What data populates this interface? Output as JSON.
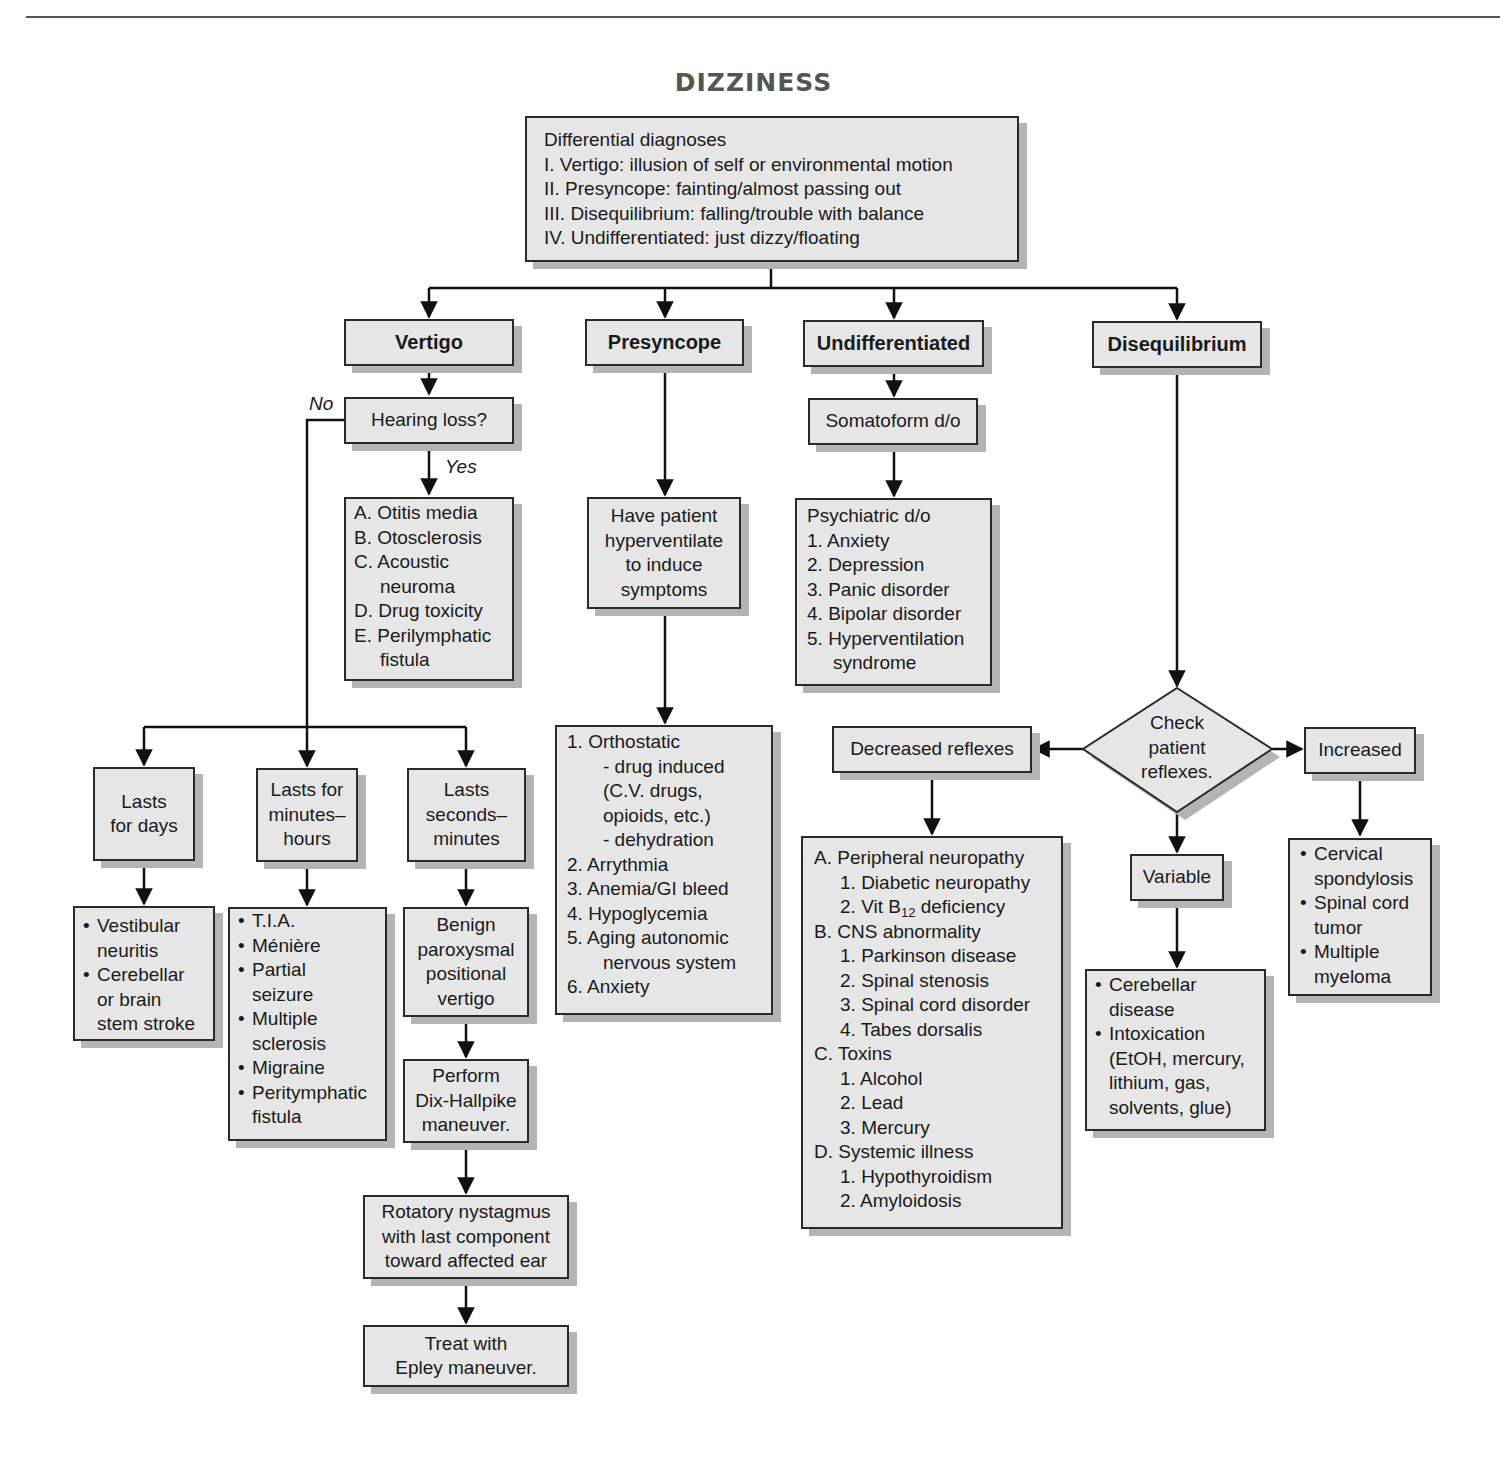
{
  "title": "DIZZINESS",
  "root": {
    "lines": [
      "Differential diagnoses",
      "I. Vertigo: illusion of self or environmental motion",
      "II. Presyncope: fainting/almost passing out",
      "III. Disequilibrium: falling/trouble with balance",
      "IV. Undifferentiated: just dizzy/floating"
    ]
  },
  "categories": {
    "vertigo": "Vertigo",
    "presyncope": "Presyncope",
    "undifferentiated": "Undifferentiated",
    "disequilibrium": "Disequilibrium"
  },
  "vertigo": {
    "question": "Hearing loss?",
    "no_label": "No",
    "yes_label": "Yes",
    "hearing_loss_causes": [
      {
        "marker": "A.",
        "text": "Otitis media"
      },
      {
        "marker": "B.",
        "text": "Otosclerosis"
      },
      {
        "marker": "C.",
        "text": "Acoustic",
        "cont": "neuroma"
      },
      {
        "marker": "D.",
        "text": "Drug toxicity"
      },
      {
        "marker": "E.",
        "text": "Perilymphatic",
        "cont": "fistula"
      }
    ],
    "durations": {
      "days": [
        "Lasts",
        "for days"
      ],
      "minutes_hours": [
        "Lasts for",
        "minutes–",
        "hours"
      ],
      "seconds_minutes": [
        "Lasts",
        "seconds–",
        "minutes"
      ]
    },
    "days_causes": [
      [
        "Vestibular",
        "neuritis"
      ],
      [
        "Cerebellar",
        "or brain",
        "stem stroke"
      ]
    ],
    "minutes_hours_causes": [
      [
        "T.I.A."
      ],
      [
        "Ménière"
      ],
      [
        "Partial",
        "seizure"
      ],
      [
        "Multiple",
        "sclerosis"
      ],
      [
        "Migraine"
      ],
      [
        "Peritymphatic",
        "fistula"
      ]
    ],
    "bppv": [
      "Benign",
      "paroxysmal",
      "positional",
      "vertigo"
    ],
    "dix_hallpike": [
      "Perform",
      "Dix-Hallpike",
      "maneuver."
    ],
    "nystagmus": [
      "Rotatory nystagmus",
      "with last component",
      "toward affected ear"
    ],
    "epley": [
      "Treat with",
      "Epley maneuver."
    ],
    "bullet": "•"
  },
  "presyncope": {
    "test": [
      "Have patient",
      "hyperventilate",
      "to induce",
      "symptoms"
    ],
    "causes": [
      {
        "marker": "1.",
        "text": "Orthostatic"
      },
      {
        "marker": "",
        "text": "- drug induced",
        "indent": true
      },
      {
        "marker": "",
        "text": "(C.V. drugs,",
        "indent": true
      },
      {
        "marker": "",
        "text": "opioids, etc.)",
        "indent": true
      },
      {
        "marker": "",
        "text": "- dehydration",
        "indent": true
      },
      {
        "marker": "2.",
        "text": "Arrythmia"
      },
      {
        "marker": "3.",
        "text": "Anemia/GI bleed"
      },
      {
        "marker": "4.",
        "text": "Hypoglycemia"
      },
      {
        "marker": "5.",
        "text": "Aging autonomic"
      },
      {
        "marker": "",
        "text": "nervous system",
        "indent": true
      },
      {
        "marker": "6.",
        "text": "Anxiety"
      }
    ]
  },
  "undifferentiated": {
    "somatoform": "Somatoform d/o",
    "psychiatric_header": "Psychiatric d/o",
    "psychiatric": [
      {
        "marker": "1.",
        "text": "Anxiety"
      },
      {
        "marker": "2.",
        "text": "Depression"
      },
      {
        "marker": "3.",
        "text": "Panic disorder"
      },
      {
        "marker": "4.",
        "text": "Bipolar disorder"
      },
      {
        "marker": "5.",
        "text": "Hyperventilation"
      },
      {
        "marker": "",
        "text": "syndrome",
        "indent": true
      }
    ]
  },
  "disequilibrium": {
    "decision": [
      "Check",
      "patient",
      "reflexes."
    ],
    "decreased": "Decreased reflexes",
    "increased": "Increased",
    "variable": "Variable",
    "decreased_causes": [
      {
        "marker": "A.",
        "text": "Peripheral neuropathy",
        "level": 0
      },
      {
        "marker": "1.",
        "text": "Diabetic neuropathy",
        "level": 1
      },
      {
        "marker": "2.",
        "text": "Vit B",
        "sub": "12",
        "after": " deficiency",
        "level": 1
      },
      {
        "marker": "B.",
        "text": "CNS abnormality",
        "level": 0
      },
      {
        "marker": "1.",
        "text": "Parkinson disease",
        "level": 1
      },
      {
        "marker": "2.",
        "text": "Spinal stenosis",
        "level": 1
      },
      {
        "marker": "3.",
        "text": "Spinal cord disorder",
        "level": 1
      },
      {
        "marker": "4.",
        "text": "Tabes dorsalis",
        "level": 1
      },
      {
        "marker": "C.",
        "text": "Toxins",
        "level": 0
      },
      {
        "marker": "1.",
        "text": "Alcohol",
        "level": 1
      },
      {
        "marker": "2.",
        "text": "Lead",
        "level": 1
      },
      {
        "marker": "3.",
        "text": "Mercury",
        "level": 1
      },
      {
        "marker": "D.",
        "text": "Systemic illness",
        "level": 0
      },
      {
        "marker": "1.",
        "text": "Hypothyroidism",
        "level": 1
      },
      {
        "marker": "2.",
        "text": "Amyloidosis",
        "level": 1
      }
    ],
    "variable_causes": [
      [
        "Cerebellar",
        "disease"
      ],
      [
        "Intoxication",
        "(EtOH, mercury,",
        "lithium, gas,",
        "solvents, glue)"
      ]
    ],
    "increased_causes": [
      [
        "Cervical",
        "spondylosis"
      ],
      [
        "Spinal cord",
        "tumor"
      ],
      [
        "Multiple",
        "myeloma"
      ]
    ]
  },
  "colors": {
    "box_fill": "#e6e6e6",
    "box_border": "#2a2a2a",
    "shadow": "#b4b4b4",
    "title": "#555555",
    "line": "#111111"
  }
}
